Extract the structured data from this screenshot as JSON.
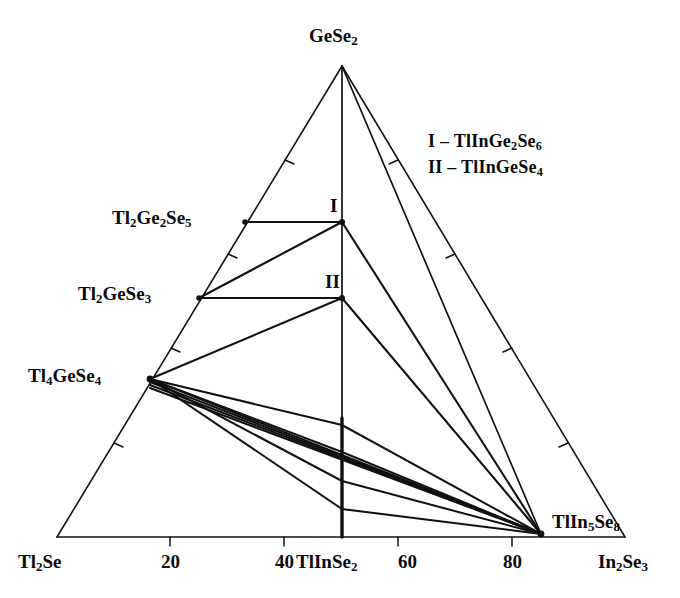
{
  "figure": {
    "type": "ternary-phase-diagram",
    "corners": {
      "top": "GeSe2",
      "bottom_left": "Tl2Se",
      "bottom_right": "In2Se3"
    },
    "corner_labels": {
      "top": {
        "base": "GeSe",
        "sub": "2"
      },
      "bottom_left": {
        "base1": "Tl",
        "sub1": "2",
        "base2": "Se"
      },
      "bottom_right": {
        "base1": "In",
        "sub1": "2",
        "base2": "Se",
        "sub2": "3"
      }
    }
  },
  "axis": {
    "ticks": [
      {
        "label": "20",
        "value": 20
      },
      {
        "label": "40",
        "value": 40
      },
      {
        "label": "60",
        "value": 60
      },
      {
        "label": "80",
        "value": 80
      }
    ]
  },
  "compounds": {
    "tl2ge2se5": {
      "base1": "Tl",
      "sub1": "2",
      "base2": "Ge",
      "sub2": "2",
      "base3": "Se",
      "sub3": "5"
    },
    "tl2gese3": {
      "base1": "Tl",
      "sub1": "2",
      "base2": "GeSe",
      "sub2": "3"
    },
    "tl4gese4": {
      "base1": "Tl",
      "sub1": "4",
      "base2": "GeSe",
      "sub2": "4"
    },
    "tlinse2": {
      "base1": "TlInSe",
      "sub1": "2"
    },
    "tlin5se8": {
      "base1": "TlIn",
      "sub1": "5",
      "base2": "Se",
      "sub2": "8"
    }
  },
  "points": {
    "I": "I",
    "II": "II"
  },
  "legend": {
    "items": [
      {
        "key": "I",
        "dash": "–",
        "base1": "TlInGe",
        "sub1": "2",
        "base2": "Se",
        "sub2": "6"
      },
      {
        "key": "II",
        "dash": "–",
        "base1": "TlInGeSe",
        "sub1": "4"
      }
    ]
  },
  "chart_data": {
    "type": "scatter",
    "title": "",
    "subtitle": "",
    "xlabel": "",
    "ylabel": "",
    "grid": false,
    "legend_position": "upper-right",
    "diagram_type": "ternary isothermal section",
    "components": [
      "Tl2Se",
      "GeSe2",
      "In2Se3"
    ],
    "axis_ranges": {
      "bottom": [
        0,
        100
      ]
    },
    "bottom_axis_ticks": [
      20,
      40,
      60,
      80
    ],
    "vertices": [
      {
        "name": "GeSe2",
        "label": "GeSe2",
        "x": 342,
        "y": 66,
        "role": "apex"
      },
      {
        "name": "Tl2Se",
        "label": "Tl2Se",
        "x": 57,
        "y": 537,
        "role": "left-corner"
      },
      {
        "name": "In2Se3",
        "label": "In2Se3",
        "x": 625,
        "y": 537,
        "role": "right-corner"
      }
    ],
    "nodes": [
      {
        "name": "Tl2Ge2Se5",
        "label": "Tl2Ge2Se5",
        "x": 245,
        "y": 222,
        "edge": "Tl2Se-GeSe2"
      },
      {
        "name": "Tl2GeSe3",
        "label": "Tl2GeSe3",
        "x": 199,
        "y": 298,
        "edge": "Tl2Se-GeSe2"
      },
      {
        "name": "Tl4GeSe4",
        "label": "Tl4GeSe4",
        "x": 150,
        "y": 379,
        "edge": "Tl2Se-GeSe2"
      },
      {
        "name": "TlInSe2",
        "label": "TlInSe2",
        "x": 342,
        "y": 537,
        "edge": "Tl2Se-In2Se3"
      },
      {
        "name": "TlIn5Se8",
        "label": "TlIn5Se8",
        "x": 541,
        "y": 534,
        "edge": "Tl2Se-In2Se3"
      },
      {
        "name": "I",
        "label": "TlInGe2Se6",
        "x": 342,
        "y": 222,
        "edge": "GeSe2-TlInSe2"
      },
      {
        "name": "II",
        "label": "TlInGeSe4",
        "x": 342,
        "y": 298,
        "edge": "GeSe2-TlInSe2"
      }
    ],
    "tie_lines": [
      {
        "from": "Tl2Ge2Se5",
        "to": "I"
      },
      {
        "from": "Tl2GeSe3",
        "to": "II"
      },
      {
        "from": "Tl2GeSe3",
        "to": "I"
      },
      {
        "from": "Tl4GeSe4",
        "to": "II"
      },
      {
        "from": "GeSe2",
        "to": "TlInSe2"
      },
      {
        "from": "GeSe2",
        "to": "TlIn5Se8"
      },
      {
        "from": "I",
        "to": "TlIn5Se8"
      },
      {
        "from": "II",
        "to": "TlIn5Se8"
      },
      {
        "from": "Tl4GeSe4",
        "to": "TlIn5Se8"
      },
      {
        "from": "Tl4GeSe4",
        "to": "TlIn5Se8-via-cross-1"
      },
      {
        "from": "Tl4GeSe4",
        "to": "TlIn5Se8-via-cross-2"
      },
      {
        "from": "Tl4GeSe4",
        "to": "TlIn5Se8-via-cross-3"
      }
    ]
  }
}
